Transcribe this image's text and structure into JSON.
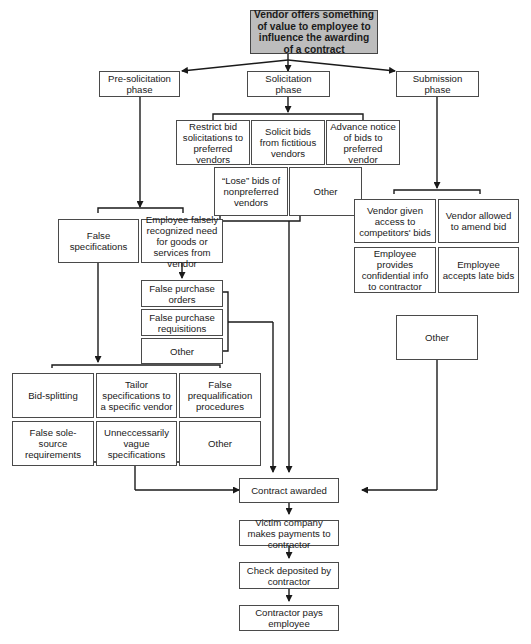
{
  "diagram": {
    "root": "Vendor offers something of value to employee to influence the awarding of a contract",
    "phases": {
      "pre": "Pre-solicitation phase",
      "solicitation": "Solicitation phase",
      "submission": "Submission phase"
    },
    "solicitation_schemes": {
      "restrict": "Restrict bid solicitations to preferred vendors",
      "fictitious": "Solicit bids from fictitious vendors",
      "advance": "Advance notice of bids to preferred vendor",
      "lose": "“Lose” bids of nonpreferred vendors",
      "other": "Other"
    },
    "pre_schemes": {
      "false_specs": "False specifications",
      "false_need": "Employee falsely recognized need for goods or services from vendor"
    },
    "need_schemes": {
      "po": "False purchase orders",
      "req": "False purchase requisitions",
      "other": "Other"
    },
    "spec_schemes": {
      "bid_splitting": "Bid-splitting",
      "tailor": "Tailor specifications to a specific vendor",
      "prequal": "False prequalification procedures",
      "sole_source": "False sole-source requirements",
      "vague": "Unneccessarily vague specifications",
      "other": "Other"
    },
    "submission_schemes": {
      "access": "Vendor given access to competitors' bids",
      "amend": "Vendor allowed to amend bid",
      "confidential": "Employee provides confidential info to contractor",
      "late": "Employee accepts late bids",
      "other": "Other"
    },
    "outcome": {
      "awarded": "Contract awarded",
      "payments": "Victim company makes payments to contractor",
      "deposited": "Check deposited by contractor",
      "pays": "Contractor pays employee"
    },
    "colors": {
      "root_fill": "#bdbdbd",
      "line": "#1a1a1a",
      "box_border": "#4a4a4a"
    }
  }
}
